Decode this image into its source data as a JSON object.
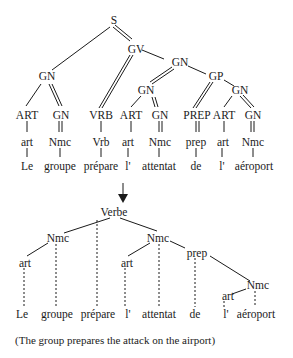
{
  "top_tree": {
    "root": "S",
    "gv": "GV",
    "gn_subject": "GN",
    "gn_object": "GN",
    "gp": "GP",
    "gn_inner_object": "GN",
    "gn_inner_gp": "GN",
    "categories": [
      "ART",
      "GN",
      "VRB",
      "ART",
      "GN",
      "PREP",
      "ART",
      "GN"
    ],
    "tags": [
      "art",
      "Nmc",
      "Vrb",
      "art",
      "Nmc",
      "prep",
      "art",
      "Nmc"
    ],
    "words": [
      "Le",
      "groupe",
      "prépare",
      "l'",
      "attentat",
      "de",
      "l'",
      "aéroport"
    ]
  },
  "arrow": "transform-arrow",
  "bottom_tree": {
    "root": "Verbe",
    "nmc_subject": "Nmc",
    "nmc_object": "Nmc",
    "prep": "prep",
    "nmc_prep": "Nmc",
    "art_subject": "art",
    "art_object": "art",
    "art_prep": "art",
    "words": [
      "Le",
      "groupe",
      "prépare",
      "l'",
      "attentat",
      "de",
      "l'",
      "aéroport"
    ]
  },
  "caption": "(The group prepares the attack on the airport)"
}
